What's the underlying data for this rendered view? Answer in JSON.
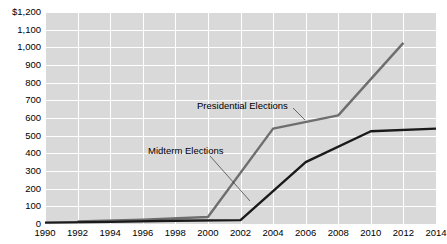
{
  "chart_data": {
    "type": "line",
    "title": "",
    "xlabel": "",
    "ylabel": "",
    "xlim": [
      1990,
      2014
    ],
    "ylim": [
      0,
      1200
    ],
    "grid": true,
    "legend_position": "inline-annotations",
    "x_ticks": [
      "1990",
      "1992",
      "1994",
      "1996",
      "1998",
      "2000",
      "2002",
      "2004",
      "2006",
      "2008",
      "2010",
      "2012",
      "2014"
    ],
    "y_ticks": [
      "$1,200",
      "1,100",
      "1,000",
      "900",
      "800",
      "700",
      "600",
      "500",
      "400",
      "300",
      "200",
      "100",
      "0"
    ],
    "y_axis_prefix": "$",
    "series": [
      {
        "name": "Presidential Elections",
        "color": "#6e6e6e",
        "x": [
          1992,
          1996,
          2000,
          2004,
          2008,
          2012
        ],
        "values": [
          14,
          25,
          40,
          540,
          615,
          1025
        ]
      },
      {
        "name": "Midterm Elections",
        "color": "#1a1a1a",
        "x": [
          1990,
          1994,
          1998,
          2002,
          2006,
          2010,
          2014
        ],
        "values": [
          8,
          12,
          18,
          22,
          350,
          525,
          540
        ]
      }
    ],
    "annotations": [
      {
        "text": "Presidential Elections",
        "series": "Presidential Elections"
      },
      {
        "text": "Midterm Elections",
        "series": "Midterm Elections"
      }
    ]
  }
}
